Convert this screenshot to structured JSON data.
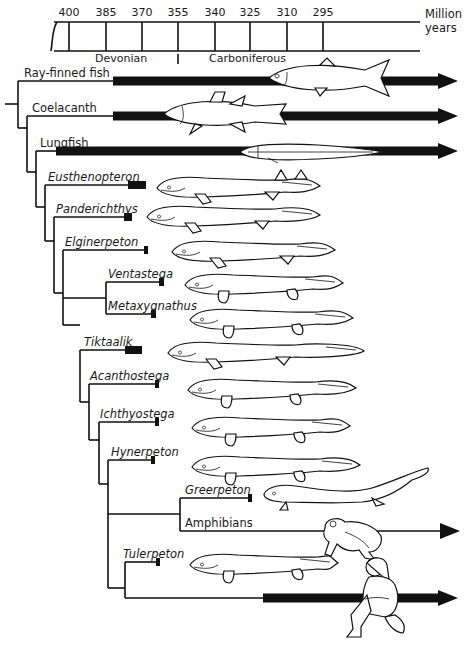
{
  "timeline": {
    "unit_label_line1": "Million",
    "unit_label_line2": "years",
    "ticks": [
      {
        "label": "400",
        "x": 69
      },
      {
        "label": "385",
        "x": 106
      },
      {
        "label": "370",
        "x": 142
      },
      {
        "label": "355",
        "x": 178
      },
      {
        "label": "340",
        "x": 215
      },
      {
        "label": "325",
        "x": 250
      },
      {
        "label": "310",
        "x": 287
      },
      {
        "label": "295",
        "x": 323
      }
    ],
    "periods": [
      {
        "label": "Devonian",
        "x": 95
      },
      {
        "label": "Carboniferous",
        "x": 209
      }
    ],
    "period_boundary_x": 178
  },
  "taxa": [
    {
      "name": "Ray-finned fish",
      "italic": false,
      "y": 81,
      "label_x": 24,
      "branch_x": 18,
      "bar_start": 113,
      "bar_end": 438,
      "living": true,
      "thick": true
    },
    {
      "name": "Coelacanth",
      "italic": false,
      "y": 116,
      "label_x": 32,
      "branch_x": 27,
      "bar_start": 113,
      "bar_end": 438,
      "living": true,
      "thick": true
    },
    {
      "name": "Lungfish",
      "italic": false,
      "y": 151,
      "label_x": 40,
      "branch_x": 36,
      "bar_start": 56,
      "bar_end": 438,
      "living": true,
      "thick": true
    },
    {
      "name": "Eusthenopteron",
      "italic": true,
      "y": 185,
      "label_x": 48,
      "branch_x": 45,
      "bar_start": 128,
      "bar_end": 146,
      "living": false
    },
    {
      "name": "Panderichthys",
      "italic": true,
      "y": 217,
      "label_x": 56,
      "branch_x": 54,
      "bar_start": 124,
      "bar_end": 132,
      "living": false
    },
    {
      "name": "Elginerpeton",
      "italic": true,
      "y": 250,
      "label_x": 65,
      "branch_x": 63,
      "bar_start": 144,
      "bar_end": 148,
      "living": false
    },
    {
      "name": "Ventastega",
      "italic": true,
      "y": 282,
      "label_x": 108,
      "branch_x": 106,
      "bar_start": 159,
      "bar_end": 164,
      "living": false
    },
    {
      "name": "Metaxygnathus",
      "italic": true,
      "y": 314,
      "label_x": 108,
      "branch_x": 106,
      "bar_start": 151,
      "bar_end": 156,
      "living": false
    },
    {
      "name": "Tiktaalik",
      "italic": true,
      "y": 350,
      "label_x": 84,
      "branch_x": 80,
      "bar_start": 125,
      "bar_end": 142,
      "living": false
    },
    {
      "name": "Acanthostega",
      "italic": true,
      "y": 384,
      "label_x": 90,
      "branch_x": 89,
      "bar_start": 155,
      "bar_end": 159,
      "living": false
    },
    {
      "name": "Ichthyostega",
      "italic": true,
      "y": 422,
      "label_x": 100,
      "branch_x": 99,
      "bar_start": 155,
      "bar_end": 159,
      "living": false
    },
    {
      "name": "Hynerpeton",
      "italic": true,
      "y": 460,
      "label_x": 111,
      "branch_x": 108,
      "bar_start": 151,
      "bar_end": 155,
      "living": false
    },
    {
      "name": "Greerpeton",
      "italic": true,
      "y": 498,
      "label_x": 185,
      "branch_x": 180,
      "bar_start": 248,
      "bar_end": 252,
      "living": false
    },
    {
      "name": "Amphibians",
      "italic": false,
      "y": 531,
      "label_x": 185,
      "branch_x": 180,
      "bar_start": 180,
      "bar_end": 440,
      "living": true,
      "thick": false
    },
    {
      "name": "Tulerpeton",
      "italic": true,
      "y": 562,
      "label_x": 123,
      "branch_x": 125,
      "bar_start": 156,
      "bar_end": 160,
      "living": false
    },
    {
      "name": "",
      "italic": false,
      "y": 598,
      "label_x": 125,
      "branch_x": 125,
      "bar_start": 263,
      "bar_end": 438,
      "living": true,
      "thick": true
    }
  ],
  "nodes": [
    {
      "x": 18,
      "y1": 81,
      "y2": 128
    },
    {
      "x": 27,
      "y1": 116,
      "y2": 172
    },
    {
      "x": 36,
      "y1": 151,
      "y2": 207
    },
    {
      "x": 45,
      "y1": 185,
      "y2": 241
    },
    {
      "x": 54,
      "y1": 217,
      "y2": 293
    },
    {
      "x": 63,
      "y1": 250,
      "y2": 325
    },
    {
      "x": 106,
      "y1": 282,
      "y2": 314
    },
    {
      "x": 80,
      "y1": 350,
      "y2": 402
    },
    {
      "x": 89,
      "y1": 384,
      "y2": 440
    },
    {
      "x": 99,
      "y1": 422,
      "y2": 484
    },
    {
      "x": 108,
      "y1": 460,
      "y2": 588
    },
    {
      "x": 180,
      "y1": 498,
      "y2": 531
    },
    {
      "x": 125,
      "y1": 562,
      "y2": 598
    }
  ],
  "node_links": [
    {
      "from_x": 5,
      "to_x": 18,
      "y": 104
    },
    {
      "from_x": 18,
      "to_x": 27,
      "y": 128
    },
    {
      "from_x": 27,
      "to_x": 36,
      "y": 172
    },
    {
      "from_x": 36,
      "to_x": 45,
      "y": 207
    },
    {
      "from_x": 45,
      "to_x": 54,
      "y": 241
    },
    {
      "from_x": 54,
      "to_x": 63,
      "y": 293
    },
    {
      "from_x": 63,
      "to_x": 106,
      "y": 298
    },
    {
      "from_x": 63,
      "to_x": 80,
      "y": 325
    },
    {
      "from_x": 80,
      "to_x": 89,
      "y": 402
    },
    {
      "from_x": 89,
      "to_x": 99,
      "y": 440
    },
    {
      "from_x": 99,
      "to_x": 108,
      "y": 484
    },
    {
      "from_x": 108,
      "to_x": 180,
      "y": 514
    },
    {
      "from_x": 108,
      "to_x": 125,
      "y": 588
    }
  ],
  "illustrations": [
    {
      "name": "ray-finned-fish",
      "x": 265,
      "y": 58,
      "w": 130,
      "h": 40
    },
    {
      "name": "coelacanth",
      "x": 160,
      "y": 92,
      "w": 130,
      "h": 44
    },
    {
      "name": "lungfish",
      "x": 238,
      "y": 142,
      "w": 145,
      "h": 20
    },
    {
      "name": "eusthenopteron",
      "x": 155,
      "y": 170,
      "w": 165,
      "h": 36
    },
    {
      "name": "panderichthys",
      "x": 145,
      "y": 206,
      "w": 175,
      "h": 22
    },
    {
      "name": "elginerpeton",
      "x": 170,
      "y": 237,
      "w": 165,
      "h": 30
    },
    {
      "name": "ventastega",
      "x": 183,
      "y": 270,
      "w": 160,
      "h": 30
    },
    {
      "name": "metaxygnathus",
      "x": 188,
      "y": 305,
      "w": 165,
      "h": 30
    },
    {
      "name": "tiktaalik",
      "x": 166,
      "y": 338,
      "w": 198,
      "h": 30
    },
    {
      "name": "acanthostega",
      "x": 186,
      "y": 375,
      "w": 170,
      "h": 30
    },
    {
      "name": "ichthyostega",
      "x": 190,
      "y": 412,
      "w": 160,
      "h": 32
    },
    {
      "name": "hynerpeton",
      "x": 190,
      "y": 450,
      "w": 170,
      "h": 34
    },
    {
      "name": "greerpeton",
      "x": 262,
      "y": 466,
      "w": 168,
      "h": 40
    },
    {
      "name": "frog",
      "x": 315,
      "y": 514,
      "w": 70,
      "h": 48
    },
    {
      "name": "tulerpeton",
      "x": 188,
      "y": 545,
      "w": 150,
      "h": 40
    },
    {
      "name": "human",
      "x": 345,
      "y": 555,
      "w": 65,
      "h": 85
    }
  ],
  "colors": {
    "ink": "#111111",
    "background": "#ffffff"
  }
}
